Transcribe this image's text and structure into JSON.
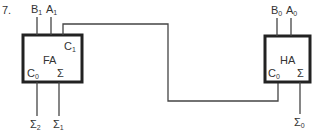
{
  "problem_number": "7.",
  "blocks": [
    {
      "id": "fa",
      "label": "FA",
      "inputs": [
        {
          "name": "B",
          "sub": "1"
        },
        {
          "name": "A",
          "sub": "1"
        }
      ],
      "ports": {
        "carry_out": {
          "name": "C",
          "sub": "1"
        },
        "carry_in": {
          "name": "C",
          "sub": "0"
        },
        "sum": "Σ"
      },
      "outputs": [
        {
          "name": "Σ",
          "sub": "2"
        },
        {
          "name": "Σ",
          "sub": "1"
        }
      ]
    },
    {
      "id": "ha",
      "label": "HA",
      "inputs": [
        {
          "name": "B",
          "sub": "0"
        },
        {
          "name": "A",
          "sub": "0"
        }
      ],
      "ports": {
        "carry_in": {
          "name": "C",
          "sub": "0"
        },
        "sum": "Σ"
      },
      "outputs": [
        {
          "name": "Σ",
          "sub": "0"
        }
      ]
    }
  ],
  "colors": {
    "line": "#333333",
    "box": "#222222"
  }
}
